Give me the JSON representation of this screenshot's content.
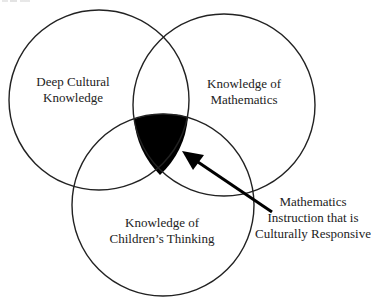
{
  "diagram": {
    "type": "venn",
    "circles": [
      {
        "id": "left",
        "label_lines": [
          "Deep Cultural",
          "Knowledge"
        ]
      },
      {
        "id": "right",
        "label_lines": [
          "Knowledge of",
          "Mathematics"
        ]
      },
      {
        "id": "bottom",
        "label_lines": [
          "Knowledge of",
          "Children’s Thinking"
        ]
      }
    ],
    "intersection": {
      "fill_color": "#000000",
      "callout_lines": [
        "Mathematics",
        "Instruction that is",
        "Culturally Responsive"
      ]
    },
    "stroke_color": "#222222"
  }
}
